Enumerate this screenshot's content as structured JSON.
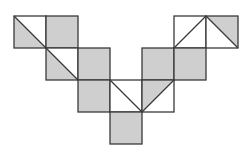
{
  "diagram": {
    "colors": {
      "shade": "#cfcfcf",
      "line": "#3a3a3a",
      "background": "#ffffff"
    },
    "grid": {
      "origin_x": 14,
      "origin_y": 16,
      "cell": 32
    },
    "cells": [
      {
        "row": 0,
        "col": 0,
        "fill": "half",
        "diagonal": "tl-br",
        "shaded": "lower-left"
      },
      {
        "row": 0,
        "col": 1,
        "fill": "full"
      },
      {
        "row": 0,
        "col": 5,
        "fill": "none",
        "diagonal": "bl-tr"
      },
      {
        "row": 0,
        "col": 6,
        "fill": "half",
        "diagonal": "tl-br",
        "shaded": "upper-right"
      },
      {
        "row": 1,
        "col": 1,
        "fill": "half",
        "diagonal": "tl-br",
        "shaded": "lower-left"
      },
      {
        "row": 1,
        "col": 2,
        "fill": "full"
      },
      {
        "row": 1,
        "col": 4,
        "fill": "full"
      },
      {
        "row": 1,
        "col": 5,
        "fill": "full"
      },
      {
        "row": 2,
        "col": 2,
        "fill": "full"
      },
      {
        "row": 2,
        "col": 3,
        "fill": "none",
        "diagonal": "tl-br"
      },
      {
        "row": 2,
        "col": 4,
        "fill": "half",
        "diagonal": "bl-tr",
        "shaded": "upper-left"
      },
      {
        "row": 3,
        "col": 3,
        "fill": "full"
      }
    ]
  }
}
